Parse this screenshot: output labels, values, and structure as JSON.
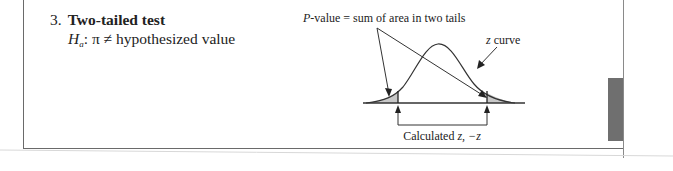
{
  "item": {
    "number": "3.",
    "title": "Two-tailed test",
    "hypothesis_symbol": "H",
    "hypothesis_subscript": "a",
    "hypothesis_text": ": π ≠ hypothesized value"
  },
  "diagram": {
    "pvalue_label_prefix": "P",
    "pvalue_label_rest": "-value = sum of area in two tails",
    "curve_label_var": "z",
    "curve_label_rest": " curve",
    "calc_label_prefix": "Calculated ",
    "calc_label_vars": "z, −z",
    "tail_fill": "#c8c8c8",
    "line_color": "#333333"
  },
  "page": {
    "tab_color": "#6f6f6f"
  }
}
